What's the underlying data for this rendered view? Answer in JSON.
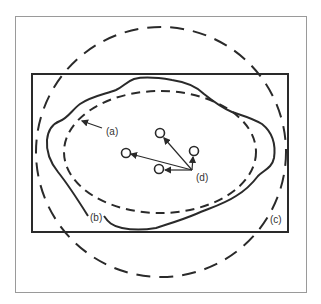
{
  "diagram": {
    "labels": {
      "a": "(a)",
      "b": "(b)",
      "c": "(c)",
      "d": "(d)"
    },
    "colors": {
      "frame": "#9a9a9a",
      "stroke": "#2a2a2a",
      "background": "#ffffff"
    },
    "elements": [
      {
        "id": "a",
        "shape": "irregular-closed-solid-curve"
      },
      {
        "id": "b",
        "shape": "dashed-inner-ellipse"
      },
      {
        "id": "c",
        "shape": "dashed-outer-circle"
      },
      {
        "id": "d",
        "shape": "four-small-circles-with-arrows-from-common-point"
      }
    ],
    "outer_rectangle": "solid-rectangle"
  }
}
